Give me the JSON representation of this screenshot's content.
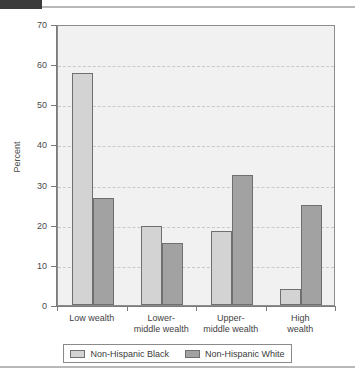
{
  "chart_data": {
    "type": "bar",
    "title": "",
    "xlabel": "",
    "ylabel": "Percent",
    "ylim": [
      0,
      70
    ],
    "ytick_step": 10,
    "yticks": [
      70,
      60,
      50,
      40,
      30,
      20,
      10,
      0
    ],
    "grid": true,
    "grid_style": "dashed-horizontal",
    "legend_position": "bottom",
    "categories": [
      "Low wealth",
      "Lower-\nmiddle wealth",
      "Upper-\nmiddle wealth",
      "High\nwealth"
    ],
    "category_lines": [
      [
        "Low wealth"
      ],
      [
        "Lower-",
        "middle wealth"
      ],
      [
        "Upper-",
        "middle wealth"
      ],
      [
        "High",
        "wealth"
      ]
    ],
    "series": [
      {
        "name": "Non-Hispanic Black",
        "color": "#d3d3d3",
        "values": [
          57.8,
          19.6,
          18.5,
          4.1
        ]
      },
      {
        "name": "Non-Hispanic White",
        "color": "#a2a2a2",
        "values": [
          26.7,
          15.4,
          32.4,
          24.8
        ]
      }
    ]
  },
  "axis": {
    "y_title": "Percent",
    "y_tick_labels": [
      "70",
      "60",
      "50",
      "40",
      "30",
      "20",
      "10",
      "0"
    ]
  },
  "legend": {
    "items": [
      {
        "label": "Non-Hispanic Black"
      },
      {
        "label": "Non-Hispanic White"
      }
    ]
  },
  "colors": {
    "series_black": "#d3d3d3",
    "series_white": "#a2a2a2",
    "plot_background": "#f1f1f1",
    "axis": "#7a7a7a",
    "gridline": "#c9c9c9",
    "rule": "#b9b9b9",
    "tab": "#3b3b3b"
  }
}
